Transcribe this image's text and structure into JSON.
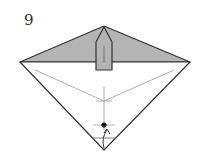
{
  "diagram": {
    "type": "origami-step",
    "step_number": "9",
    "colors": {
      "paper_back": "#b4b4b4",
      "paper_front": "#ffffff",
      "line": "#333333",
      "crease": "#999999"
    },
    "elements": [
      "gray-top-triangle",
      "center-flap",
      "white-bottom-triangle",
      "valley-crease-lines",
      "reference-point-dot",
      "fold-up-arrow"
    ]
  }
}
